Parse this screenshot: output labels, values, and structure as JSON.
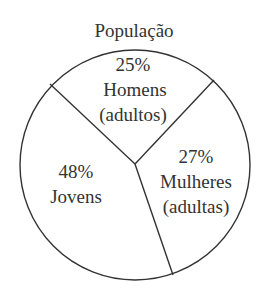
{
  "chart_data": {
    "type": "pie",
    "title": "População",
    "slices": [
      {
        "name": "Homens (adultos)",
        "value": 25,
        "label_lines": [
          "25%",
          "Homens",
          "(adultos)"
        ]
      },
      {
        "name": "Mulheres (adultas)",
        "value": 27,
        "label_lines": [
          "27%",
          "Mulheres",
          "(adultas)"
        ]
      },
      {
        "name": "Jovens",
        "value": 48,
        "label_lines": [
          "48%",
          "Jovens"
        ]
      }
    ],
    "unit": "%",
    "legend": "none",
    "colors": {
      "stroke": "#333333",
      "fill": "#ffffff",
      "text": "#333333"
    }
  }
}
